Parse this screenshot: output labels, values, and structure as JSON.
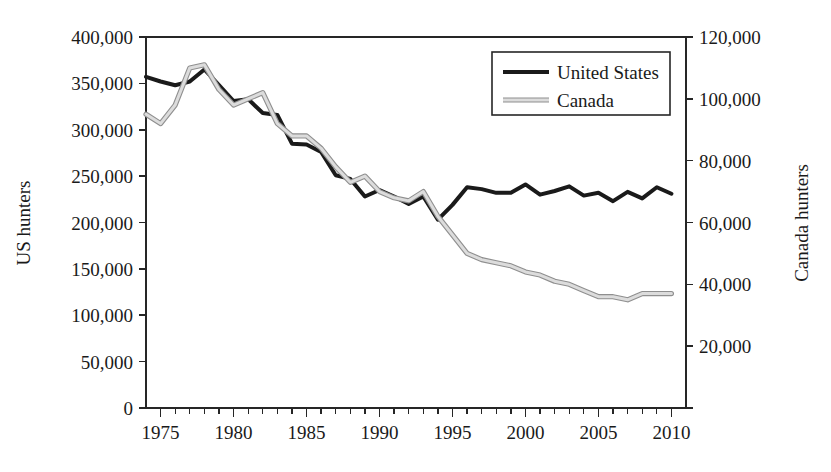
{
  "chart_data": {
    "type": "line",
    "title": "",
    "xlabel": "",
    "ylabel": "US hunters",
    "y2label": "Canada hunters",
    "xlim": [
      1974,
      2011
    ],
    "ylim": [
      0,
      400000
    ],
    "y2lim": [
      0,
      120000
    ],
    "grid": false,
    "legend_position": "top-right",
    "x_tick_labels": [
      "1975",
      "1980",
      "1985",
      "1990",
      "1995",
      "2000",
      "2005",
      "2010"
    ],
    "x_tick_values": [
      1975,
      1980,
      1985,
      1990,
      1995,
      2000,
      2005,
      2010
    ],
    "x_minor_tick_step": 1,
    "y_tick_labels": [
      "0",
      "50,000",
      "100,000",
      "150,000",
      "200,000",
      "250,000",
      "300,000",
      "350,000",
      "400,000"
    ],
    "y_tick_values": [
      0,
      50000,
      100000,
      150000,
      200000,
      250000,
      300000,
      350000,
      400000
    ],
    "y2_tick_labels": [
      "",
      "20,000",
      "40,000",
      "60,000",
      "80,000",
      "100,000",
      "120,000"
    ],
    "y2_tick_values": [
      0,
      20000,
      40000,
      60000,
      80000,
      100000,
      120000
    ],
    "x": [
      1974,
      1975,
      1976,
      1977,
      1978,
      1979,
      1980,
      1981,
      1982,
      1983,
      1984,
      1985,
      1986,
      1987,
      1988,
      1989,
      1990,
      1991,
      1992,
      1993,
      1994,
      1995,
      1996,
      1997,
      1998,
      1999,
      2000,
      2001,
      2002,
      2003,
      2004,
      2005,
      2006,
      2007,
      2008,
      2009,
      2010
    ],
    "series": [
      {
        "name": "United States",
        "axis": "left",
        "color": "#1a1a1a",
        "values": [
          357000,
          352000,
          348000,
          352000,
          365000,
          348000,
          331000,
          333000,
          318000,
          316000,
          285000,
          284000,
          276000,
          251000,
          247000,
          228000,
          235000,
          228000,
          220000,
          228000,
          203000,
          219000,
          238000,
          236000,
          232000,
          232000,
          241000,
          230000,
          234000,
          239000,
          229000,
          232000,
          223000,
          233000,
          226000,
          238000,
          231000
        ]
      },
      {
        "name": "Canada",
        "axis": "right",
        "color": "#b3b3b3",
        "values": [
          95000,
          92000,
          98000,
          110000,
          111000,
          103000,
          98000,
          100000,
          102000,
          92000,
          88000,
          88000,
          84000,
          78000,
          73000,
          75000,
          70000,
          68000,
          67000,
          70000,
          62000,
          56000,
          50000,
          48000,
          47000,
          46000,
          44000,
          43000,
          41000,
          40000,
          38000,
          36000,
          36000,
          35000,
          37000,
          37000,
          37000
        ]
      }
    ],
    "legend": [
      {
        "label": "United States",
        "color": "#1a1a1a",
        "style": "solid-thick"
      },
      {
        "label": "Canada",
        "color": "#b3b3b3",
        "style": "solid-thick"
      }
    ]
  }
}
